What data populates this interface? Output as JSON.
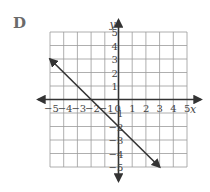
{
  "problem_label": "D",
  "chart_data": {
    "type": "line",
    "title": "",
    "xlabel": "x",
    "ylabel": "y",
    "xlim": [
      -5,
      5
    ],
    "ylim": [
      -5,
      5
    ],
    "grid": true,
    "x_ticks": [
      -5,
      -4,
      -3,
      -2,
      -1,
      0,
      1,
      2,
      3,
      4,
      5
    ],
    "y_ticks": [
      -5,
      -4,
      -3,
      -2,
      -1,
      1,
      2,
      3,
      4,
      5
    ],
    "x_tick_labels": [
      "−5",
      "−4",
      "−3",
      "−2",
      "−1",
      "0",
      "1",
      "2",
      "3",
      "4",
      "5"
    ],
    "y_tick_labels": [
      "−5",
      "−4",
      "−3",
      "−2",
      "−1",
      "1",
      "2",
      "3",
      "4",
      "5"
    ],
    "series": [
      {
        "name": "y = -x - 2",
        "points": [
          [
            -5,
            3
          ],
          [
            3,
            -5
          ]
        ],
        "arrows_both_ends": true
      }
    ],
    "colors": {
      "grid": "#9a9a9a",
      "axis": "#333333",
      "line": "#333333"
    }
  }
}
